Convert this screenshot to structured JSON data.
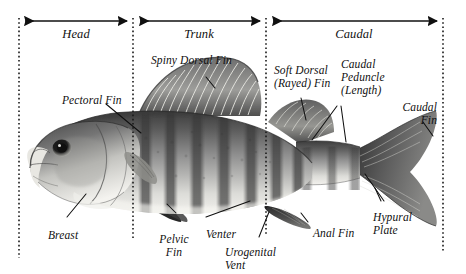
{
  "figure": {
    "background_color": "#ffffff",
    "ink_color": "#101010",
    "divider_color": "#1a1a1a"
  },
  "regions": [
    {
      "label": "Head",
      "x": 19,
      "x2": 133,
      "label_x": 76,
      "label_y": 28
    },
    {
      "label": "Trunk",
      "x": 133,
      "x2": 266,
      "label_x": 199,
      "label_y": 28
    },
    {
      "label": "Caudal",
      "x": 266,
      "x2": 443,
      "label_x": 354,
      "label_y": 28
    }
  ],
  "dividers": [
    {
      "name": "snout-line",
      "x": 19,
      "y1": 18,
      "y2": 258
    },
    {
      "name": "head-trunk",
      "x": 133,
      "y1": 18,
      "y2": 240
    },
    {
      "name": "trunk-caudal",
      "x": 266,
      "y1": 18,
      "y2": 236
    },
    {
      "name": "tail-line",
      "x": 443,
      "y1": 18,
      "y2": 252
    }
  ],
  "labels": {
    "spiny_dorsal_fin": "Spiny Dorsal Fin",
    "soft_dorsal_fin_l1": "Soft Dorsal",
    "soft_dorsal_fin_l2": "(Rayed) Fin",
    "caudal_peduncle_l1": "Caudal",
    "caudal_peduncle_l2": "Peduncle",
    "caudal_peduncle_l3": "(Length)",
    "caudal_fin_l1": "Caudal",
    "caudal_fin_l2": "Fin",
    "pectoral_fin": "Pectoral Fin",
    "breast": "Breast",
    "pelvic_fin_l1": "Pelvic",
    "pelvic_fin_l2": "Fin",
    "venter": "Venter",
    "urogenital_vent_l1": "Urogenital",
    "urogenital_vent_l2": "Vent",
    "anal_fin": "Anal Fin",
    "hypural_plate_l1": "Hypural",
    "hypural_plate_l2": "Plate"
  },
  "arrows": [
    {
      "name": "head-span-arrow",
      "x1": 22,
      "x2": 130,
      "y": 21
    },
    {
      "name": "trunk-span-arrow",
      "x1": 137,
      "x2": 263,
      "y": 21
    },
    {
      "name": "caudal-span-arrow",
      "x1": 270,
      "x2": 440,
      "y": 21
    }
  ],
  "leaders": [
    {
      "name": "spiny-dorsal-leader",
      "points": "207,77 216,86"
    },
    {
      "name": "soft-dorsal-leader",
      "points": "300,96 305,118"
    },
    {
      "name": "caudal-peduncle-leader-left",
      "points": "336,104 311,137"
    },
    {
      "name": "caudal-peduncle-leader-right",
      "points": "341,104 345,140"
    },
    {
      "name": "caudal-fin-leader",
      "points": "424,120 432,134"
    },
    {
      "name": "pectoral-fin-leader",
      "points": "106,104 140,132"
    },
    {
      "name": "breast-leader",
      "points": "66,218 84,195"
    },
    {
      "name": "pelvic-fin-leader",
      "points": "175,214 166,205"
    },
    {
      "name": "venter-leader",
      "points": "205,218 249,202"
    },
    {
      "name": "urogenital-leader",
      "points": "258,238 268,213"
    },
    {
      "name": "anal-fin-leader",
      "points": "307,223 300,214"
    },
    {
      "name": "hypural-leader-1",
      "points": "381,202 374,189"
    },
    {
      "name": "hypural-leader-2",
      "points": "383,202 364,175"
    }
  ]
}
